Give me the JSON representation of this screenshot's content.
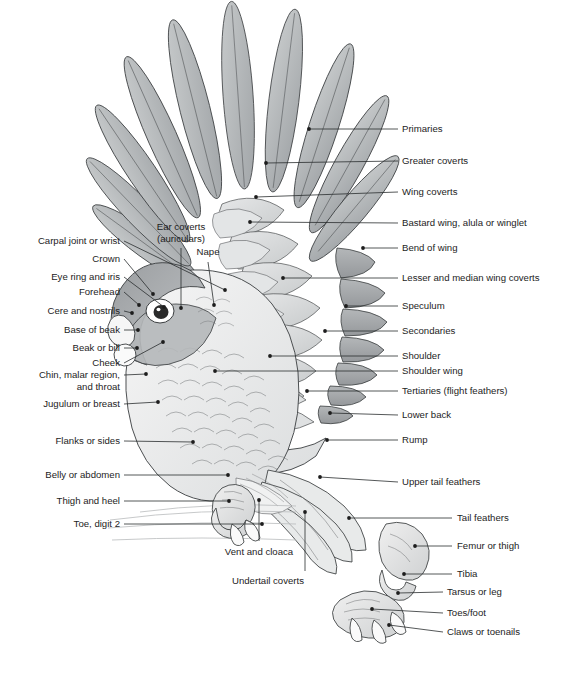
{
  "figure": {
    "background_color": "#ffffff",
    "line_color": "#1d1d1d",
    "palette": {
      "primaries_fill": "#b5b8ba",
      "secondaries_fill": "#a9acae",
      "coverts_fill": "#d6d8d9",
      "body_fill": "#eceded",
      "head_dark": "#8f9295",
      "head_mid": "#b9bcbe",
      "beak_fill": "#f4f4f4",
      "eye_ring": "#ffffff",
      "pupil": "#2b2b2b",
      "perch_fill": "#f2f2f2"
    }
  },
  "labels_right": [
    {
      "id": "primaries",
      "text": "Primaries",
      "x": 402,
      "y": 129,
      "leader": {
        "x1": 398,
        "y1": 129,
        "x2": 309,
        "y2": 129
      },
      "dot": {
        "x": 309,
        "y": 129
      }
    },
    {
      "id": "greater-coverts",
      "text": "Greater coverts",
      "x": 402,
      "y": 161,
      "leader": {
        "x1": 398,
        "y1": 161,
        "x2": 266,
        "y2": 163
      },
      "dot": {
        "x": 266,
        "y": 163
      }
    },
    {
      "id": "wing-coverts",
      "text": "Wing coverts",
      "x": 402,
      "y": 192,
      "leader": {
        "x1": 398,
        "y1": 192,
        "x2": 256,
        "y2": 197
      },
      "dot": {
        "x": 256,
        "y": 197
      }
    },
    {
      "id": "bastard-wing",
      "text": "Bastard wing, alula or winglet",
      "x": 402,
      "y": 223,
      "leader": {
        "x1": 398,
        "y1": 223,
        "x2": 250,
        "y2": 222
      },
      "dot": {
        "x": 250,
        "y": 222
      }
    },
    {
      "id": "bend-of-wing",
      "text": "Bend of wing",
      "x": 402,
      "y": 248,
      "leader": {
        "x1": 398,
        "y1": 248,
        "x2": 363,
        "y2": 248
      },
      "dot": {
        "x": 363,
        "y": 248
      }
    },
    {
      "id": "lesser-median-coverts",
      "text": "Lesser and median wing coverts",
      "x": 402,
      "y": 278,
      "leader": {
        "x1": 398,
        "y1": 278,
        "x2": 283,
        "y2": 278
      },
      "dot": {
        "x": 283,
        "y": 278
      }
    },
    {
      "id": "speculum",
      "text": "Speculum",
      "x": 402,
      "y": 306,
      "leader": {
        "x1": 398,
        "y1": 306,
        "x2": 346,
        "y2": 306
      },
      "dot": {
        "x": 346,
        "y": 306
      }
    },
    {
      "id": "secondaries",
      "text": "Secondaries",
      "x": 402,
      "y": 331,
      "leader": {
        "x1": 398,
        "y1": 331,
        "x2": 325,
        "y2": 331
      },
      "dot": {
        "x": 325,
        "y": 331
      }
    },
    {
      "id": "shoulder",
      "text": "Shoulder",
      "x": 402,
      "y": 356,
      "leader": {
        "x1": 398,
        "y1": 356,
        "x2": 270,
        "y2": 356
      },
      "dot": {
        "x": 270,
        "y": 356
      }
    },
    {
      "id": "shoulder-wing",
      "text": "Shoulder wing",
      "x": 402,
      "y": 371,
      "leader": {
        "x1": 398,
        "y1": 371,
        "x2": 215,
        "y2": 371
      },
      "dot": {
        "x": 215,
        "y": 371
      }
    },
    {
      "id": "tertiaries",
      "text": "Tertiaries (flight feathers)",
      "x": 402,
      "y": 391,
      "leader": {
        "x1": 398,
        "y1": 391,
        "x2": 307,
        "y2": 391
      },
      "dot": {
        "x": 307,
        "y": 391
      }
    },
    {
      "id": "lower-back",
      "text": "Lower back",
      "x": 402,
      "y": 415,
      "leader": {
        "x1": 398,
        "y1": 415,
        "x2": 330,
        "y2": 413
      },
      "dot": {
        "x": 330,
        "y": 413
      }
    },
    {
      "id": "rump",
      "text": "Rump",
      "x": 402,
      "y": 440,
      "leader": {
        "x1": 398,
        "y1": 440,
        "x2": 327,
        "y2": 440
      },
      "dot": {
        "x": 327,
        "y": 440
      }
    },
    {
      "id": "upper-tail-feathers",
      "text": "Upper tail feathers",
      "x": 402,
      "y": 482,
      "leader": {
        "x1": 398,
        "y1": 482,
        "x2": 320,
        "y2": 477
      },
      "dot": {
        "x": 320,
        "y": 477
      }
    },
    {
      "id": "tail-feathers",
      "text": "Tail feathers",
      "x": 457,
      "y": 518,
      "leader": {
        "x1": 452,
        "y1": 518,
        "x2": 349,
        "y2": 518
      },
      "dot": {
        "x": 349,
        "y": 518
      }
    },
    {
      "id": "femur-or-thigh",
      "text": "Femur or thigh",
      "x": 457,
      "y": 546,
      "leader": {
        "x1": 452,
        "y1": 546,
        "x2": 415,
        "y2": 546
      },
      "dot": {
        "x": 415,
        "y": 546
      }
    },
    {
      "id": "tibia",
      "text": "Tibia",
      "x": 457,
      "y": 574,
      "leader": {
        "x1": 452,
        "y1": 574,
        "x2": 404,
        "y2": 574
      },
      "dot": {
        "x": 404,
        "y": 574
      }
    },
    {
      "id": "tarsus-or-leg",
      "text": "Tarsus or leg",
      "x": 447,
      "y": 592,
      "leader": {
        "x1": 443,
        "y1": 592,
        "x2": 398,
        "y2": 593
      },
      "dot": {
        "x": 398,
        "y": 593
      }
    },
    {
      "id": "toes-foot",
      "text": "Toes/foot",
      "x": 447,
      "y": 613,
      "leader": {
        "x1": 443,
        "y1": 613,
        "x2": 372,
        "y2": 609
      },
      "dot": {
        "x": 372,
        "y": 609
      }
    },
    {
      "id": "claws-or-toenails",
      "text": "Claws or toenails",
      "x": 447,
      "y": 632,
      "leader": {
        "x1": 443,
        "y1": 632,
        "x2": 389,
        "y2": 625
      },
      "dot": {
        "x": 389,
        "y": 625
      }
    }
  ],
  "labels_left": [
    {
      "id": "carpal-joint",
      "text": "Carpal joint or wrist",
      "x": 120,
      "y": 241,
      "leader": {
        "x1": 124,
        "y1": 241,
        "x2": 225,
        "y2": 290
      },
      "dot": {
        "x": 225,
        "y": 290
      }
    },
    {
      "id": "crown",
      "text": "Crown",
      "x": 120,
      "y": 259,
      "leader": {
        "x1": 124,
        "y1": 259,
        "x2": 153,
        "y2": 294
      },
      "dot": {
        "x": 153,
        "y": 294
      }
    },
    {
      "id": "eye-ring-and-iris",
      "text": "Eye ring and iris",
      "x": 120,
      "y": 277,
      "leader": {
        "x1": 124,
        "y1": 277,
        "x2": 164,
        "y2": 307
      },
      "dot": {
        "x": 164,
        "y": 307
      }
    },
    {
      "id": "forehead",
      "text": "Forehead",
      "x": 120,
      "y": 292,
      "leader": {
        "x1": 124,
        "y1": 292,
        "x2": 139,
        "y2": 305
      },
      "dot": {
        "x": 139,
        "y": 305
      }
    },
    {
      "id": "cere-and-nostrils",
      "text": "Cere and nostrils",
      "x": 120,
      "y": 311,
      "leader": {
        "x1": 124,
        "y1": 311,
        "x2": 132,
        "y2": 313
      },
      "dot": {
        "x": 132,
        "y": 313
      }
    },
    {
      "id": "base-of-beak",
      "text": "Base of beak",
      "x": 120,
      "y": 330,
      "leader": {
        "x1": 124,
        "y1": 330,
        "x2": 138,
        "y2": 330
      },
      "dot": {
        "x": 138,
        "y": 330
      }
    },
    {
      "id": "beak-or-bill",
      "text": "Beak or bill",
      "x": 120,
      "y": 348,
      "leader": {
        "x1": 124,
        "y1": 348,
        "x2": 137,
        "y2": 348
      },
      "dot": {
        "x": 137,
        "y": 348
      }
    },
    {
      "id": "cheek",
      "text": "Cheek",
      "x": 120,
      "y": 363,
      "leader": {
        "x1": 124,
        "y1": 363,
        "x2": 163,
        "y2": 342
      },
      "dot": {
        "x": 163,
        "y": 342
      }
    },
    {
      "id": "chin-malar-throat",
      "text": "Chin, malar region,\nand throat",
      "x": 120,
      "y": 375,
      "leader": {
        "x1": 124,
        "y1": 375,
        "x2": 146,
        "y2": 374
      },
      "dot": {
        "x": 146,
        "y": 374
      }
    },
    {
      "id": "jugulum-or-breast",
      "text": "Jugulum or breast",
      "x": 120,
      "y": 404,
      "leader": {
        "x1": 124,
        "y1": 404,
        "x2": 158,
        "y2": 402
      },
      "dot": {
        "x": 158,
        "y": 402
      }
    },
    {
      "id": "flanks-or-sides",
      "text": "Flanks or sides",
      "x": 120,
      "y": 441,
      "leader": {
        "x1": 124,
        "y1": 441,
        "x2": 193,
        "y2": 442
      },
      "dot": {
        "x": 193,
        "y": 442
      }
    },
    {
      "id": "belly-or-abdomen",
      "text": "Belly or abdomen",
      "x": 120,
      "y": 475,
      "leader": {
        "x1": 124,
        "y1": 475,
        "x2": 228,
        "y2": 475
      },
      "dot": {
        "x": 228,
        "y": 475
      }
    },
    {
      "id": "thigh-and-heel",
      "text": "Thigh and heel",
      "x": 120,
      "y": 501,
      "leader": {
        "x1": 124,
        "y1": 501,
        "x2": 229,
        "y2": 501
      },
      "dot": {
        "x": 229,
        "y": 501
      }
    },
    {
      "id": "toe-digit-2",
      "text": "Toe, digit 2",
      "x": 120,
      "y": 524,
      "leader": {
        "x1": 124,
        "y1": 524,
        "x2": 262,
        "y2": 524
      },
      "dot": {
        "x": 262,
        "y": 524
      }
    }
  ],
  "labels_top": [
    {
      "id": "ear-coverts",
      "text": "Ear coverts\n(auriculars)",
      "x": 181,
      "y": 227,
      "leader": {
        "x1": 181,
        "y1": 248,
        "x2": 181,
        "y2": 308
      },
      "dot": {
        "x": 181,
        "y": 308
      }
    },
    {
      "id": "nape",
      "text": "Nape",
      "x": 208,
      "y": 252,
      "leader": {
        "x1": 208,
        "y1": 262,
        "x2": 214,
        "y2": 305
      },
      "dot": {
        "x": 214,
        "y": 305
      }
    }
  ],
  "labels_bottom": [
    {
      "id": "vent-and-cloaca",
      "text": "Vent and cloaca",
      "x": 259,
      "y": 552,
      "leader": {
        "x1": 259,
        "y1": 541,
        "x2": 259,
        "y2": 500
      },
      "dot": {
        "x": 259,
        "y": 500
      }
    },
    {
      "id": "undertail-coverts",
      "text": "Undertail coverts",
      "x": 268,
      "y": 581,
      "leader": {
        "x1": 305,
        "y1": 571,
        "x2": 305,
        "y2": 512
      },
      "dot": {
        "x": 305,
        "y": 512
      }
    }
  ]
}
